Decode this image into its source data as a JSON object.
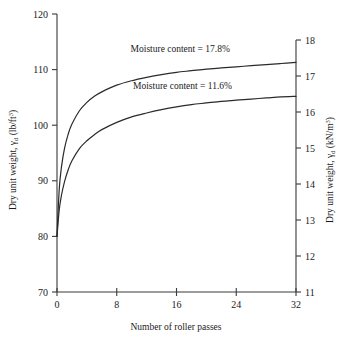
{
  "chart_data": {
    "type": "line",
    "title": "",
    "xlabel": "Number of roller passes",
    "ylabel": "Dry unit weight, γd (lb/ft3)",
    "ylabel_right": "Dry unit weight, γd (kN/m3)",
    "xlim": [
      0,
      32
    ],
    "ylim": [
      70,
      120
    ],
    "ylim_right": [
      11,
      18
    ],
    "grid": false,
    "legend_position": "inline-annotations",
    "xticks": [
      "0",
      "8",
      "16",
      "24",
      "32"
    ],
    "xtick_values": [
      0,
      8,
      16,
      24,
      32
    ],
    "yticks": [
      "70",
      "80",
      "90",
      "100",
      "110",
      "120"
    ],
    "ytick_values": [
      70,
      80,
      90,
      100,
      110,
      120
    ],
    "yticks_right": [
      "11",
      "12",
      "13",
      "14",
      "15",
      "16",
      "17",
      "18"
    ],
    "ytick_values_right": [
      11,
      12,
      13,
      14,
      15,
      16,
      17,
      18
    ],
    "series": [
      {
        "name": "Moisture content = 17.8%",
        "annotation": "Moisture content = 17.8%",
        "annotation_x": 16.5,
        "annotation_y": 113.2,
        "x": [
          0,
          0.3,
          0.6,
          1,
          1.5,
          2,
          3,
          4,
          5,
          6,
          8,
          10,
          12,
          14,
          16,
          18,
          20,
          22,
          24,
          26,
          28,
          30,
          32
        ],
        "y": [
          80,
          88.5,
          92.5,
          95.8,
          98.4,
          100.2,
          102.6,
          104.1,
          105.2,
          106.0,
          107.2,
          108.0,
          108.6,
          109.1,
          109.5,
          109.8,
          110.1,
          110.3,
          110.5,
          110.7,
          110.9,
          111.1,
          111.3
        ]
      },
      {
        "name": "Moisture content = 11.6%",
        "annotation": "Moisture content = 11.6%",
        "annotation_x": 16.8,
        "annotation_y": 106.6,
        "x": [
          0,
          0.3,
          0.6,
          1,
          1.5,
          2,
          3,
          4,
          5,
          6,
          8,
          10,
          12,
          14,
          16,
          18,
          20,
          22,
          24,
          26,
          28,
          30,
          32
        ],
        "y": [
          80,
          84.8,
          87.4,
          89.8,
          92.0,
          93.6,
          95.8,
          97.2,
          98.3,
          99.2,
          100.5,
          101.5,
          102.2,
          102.8,
          103.3,
          103.7,
          104.0,
          104.3,
          104.5,
          104.7,
          104.9,
          105.1,
          105.2
        ]
      }
    ]
  },
  "labels": {
    "y_axis_left_prefix": "Dry unit weight, ",
    "y_axis_left_gamma": "γ",
    "y_axis_left_sub": "d",
    "y_axis_left_unit": " (lb/ft",
    "y_axis_left_sup": "3",
    "y_axis_left_close": ")",
    "y_axis_right_prefix": "Dry unit weight, ",
    "y_axis_right_gamma": "γ",
    "y_axis_right_sub": "d",
    "y_axis_right_unit": " (kN/m",
    "y_axis_right_sup": "3",
    "y_axis_right_close": ")",
    "x_axis_title": "Number of roller passes"
  }
}
